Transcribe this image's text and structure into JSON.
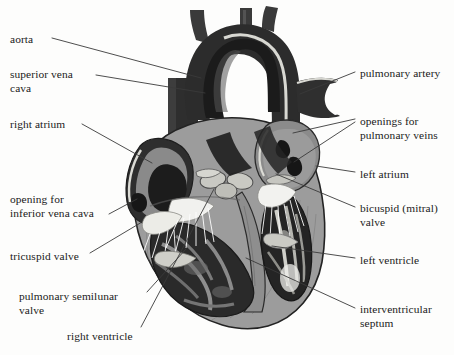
{
  "figure": {
    "background_color": "#fdfdfc",
    "line_color": "#3a3a3a",
    "text_color": "#1a1a1a"
  },
  "palette": {
    "myocardium": "#9c9c9c",
    "myocardium_dark": "#7e7e7e",
    "myocardium_light": "#b4b4b4",
    "chamber_dark": "#2b2b2b",
    "chamber_black": "#151515",
    "vessel_dark": "#333333",
    "vessel_mid": "#4e4e4e",
    "atrium_gray": "#8d8d8d",
    "valve_white": "#f2f2ef",
    "endocardium": "#d9d9d4",
    "outline": "#222222"
  },
  "labels": {
    "left": [
      {
        "id": "aorta",
        "text": "aorta",
        "x": 10,
        "y": 33,
        "lines": [
          "aorta"
        ]
      },
      {
        "id": "superior-vena-cava",
        "text": "superior vena cava",
        "x": 10,
        "y": 68,
        "lines": [
          "superior vena",
          "cava"
        ]
      },
      {
        "id": "right-atrium",
        "text": "right atrium",
        "x": 10,
        "y": 118,
        "lines": [
          "right atrium"
        ]
      },
      {
        "id": "opening-for-inferior-vena-cava",
        "text": "opening for inferior vena cava",
        "x": 10,
        "y": 193,
        "lines": [
          "opening for",
          "inferior vena cava"
        ]
      },
      {
        "id": "tricuspid-valve",
        "text": "tricuspid valve",
        "x": 10,
        "y": 250,
        "lines": [
          "tricuspid valve"
        ]
      },
      {
        "id": "pulmonary-semilunar-valve",
        "text": "pulmonary semilunar valve",
        "x": 19,
        "y": 290,
        "lines": [
          "pulmonary semilunar",
          "valve"
        ]
      },
      {
        "id": "right-ventricle",
        "text": "right ventricle",
        "x": 67,
        "y": 330,
        "lines": [
          "right ventricle"
        ]
      }
    ],
    "right": [
      {
        "id": "pulmonary-artery",
        "text": "pulmonary artery",
        "x": 360,
        "y": 67,
        "lines": [
          "pulmonary artery"
        ]
      },
      {
        "id": "openings-for-pulmonary-veins",
        "text": "openings for pulmonary veins",
        "x": 360,
        "y": 115,
        "lines": [
          "openings for",
          "pulmonary veins"
        ]
      },
      {
        "id": "left-atrium",
        "text": "left atrium",
        "x": 360,
        "y": 168,
        "lines": [
          "left atrium"
        ]
      },
      {
        "id": "bicuspid-mitral-valve",
        "text": "bicuspid (mitral) valve",
        "x": 360,
        "y": 202,
        "lines": [
          "bicuspid (mitral)",
          "valve"
        ]
      },
      {
        "id": "left-ventricle",
        "text": "left ventricle",
        "x": 360,
        "y": 254,
        "lines": [
          "left ventricle"
        ]
      },
      {
        "id": "interventricular-septum",
        "text": "interventricular septum",
        "x": 360,
        "y": 303,
        "lines": [
          "interventricular",
          "septum"
        ]
      }
    ]
  },
  "leaders": [
    {
      "id": "leader-aorta",
      "from": [
        52,
        38
      ],
      "to": [
        201,
        78
      ]
    },
    {
      "id": "leader-superior-vena-cava",
      "from": [
        96,
        75
      ],
      "to": [
        205,
        93
      ]
    },
    {
      "id": "leader-right-atrium",
      "from": [
        82,
        124
      ],
      "to": [
        152,
        163
      ]
    },
    {
      "id": "leader-opening-inferior-vena-cava",
      "from": [
        109,
        214
      ],
      "to": [
        137,
        199
      ]
    },
    {
      "id": "leader-tricuspid-valve",
      "from": [
        90,
        253
      ],
      "to": [
        142,
        222
      ]
    },
    {
      "id": "leader-pulmonary-semilunar-valve",
      "from": [
        147,
        292
      ],
      "to": [
        186,
        249
      ]
    },
    {
      "id": "leader-right-ventricle",
      "from": [
        141,
        327
      ],
      "to": [
        214,
        189
      ]
    },
    {
      "id": "leader-pulmonary-artery",
      "from": [
        355,
        72
      ],
      "to": [
        300,
        94
      ]
    },
    {
      "id": "leader-pulmonary-veins-a",
      "from": [
        355,
        119
      ],
      "to": [
        293,
        133
      ]
    },
    {
      "id": "leader-pulmonary-veins-b",
      "from": [
        355,
        122
      ],
      "to": [
        294,
        162
      ]
    },
    {
      "id": "leader-left-atrium",
      "from": [
        355,
        172
      ],
      "to": [
        316,
        166
      ]
    },
    {
      "id": "leader-bicuspid-valve",
      "from": [
        355,
        207
      ],
      "to": [
        276,
        174
      ]
    },
    {
      "id": "leader-left-ventricle",
      "from": [
        355,
        258
      ],
      "to": [
        272,
        246
      ]
    },
    {
      "id": "leader-interventricular-septum",
      "from": [
        355,
        308
      ],
      "to": [
        246,
        258
      ]
    }
  ]
}
